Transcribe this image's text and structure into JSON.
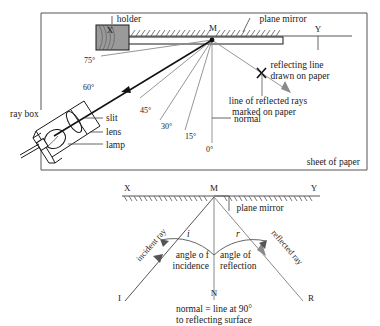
{
  "figure": {
    "title_top": "Ray box and plane mirror experiment",
    "title_bottom": "Law of reflection definitions"
  },
  "top_diagram": {
    "frame_label": "sheet of paper",
    "mirror_label": "plane mirror",
    "holder_label": "holder",
    "point_M": "M",
    "point_X": "X",
    "point_Y": "Y",
    "normal_label": "normal",
    "reflecting_line_label_1": "reflecting line",
    "reflecting_line_label_2": "drawn on paper",
    "reflected_rays_label_1": "line of reflected rays",
    "reflected_rays_label_2": "marked on paper",
    "raybox_label": "ray box",
    "slit_label": "slit",
    "lens_label": "lens",
    "lamp_label": "lamp",
    "angles": [
      "75°",
      "60°",
      "45°",
      "30°",
      "15°",
      "0°"
    ]
  },
  "bottom_diagram": {
    "point_X": "X",
    "point_M": "M",
    "point_Y": "Y",
    "point_I": "I",
    "point_N": "N",
    "point_R": "R",
    "mirror_label": "plane mirror",
    "incident_ray_label": "incident ray",
    "reflected_ray_label": "reflected ray",
    "angle_i": "i",
    "angle_r": "r",
    "angle_incidence_1": "angle o f",
    "angle_incidence_2": "incidence",
    "angle_reflection_1": "angle of",
    "angle_reflection_2": "reflection",
    "caption_1": "normal = line at 90°",
    "caption_2": "to reflecting surface"
  },
  "colors": {
    "ink": "#1a1a1a",
    "ray": "#7a7a7a",
    "main_ray": "#111111",
    "holder_fill": "#9a9a9a",
    "frame": "#555555"
  }
}
